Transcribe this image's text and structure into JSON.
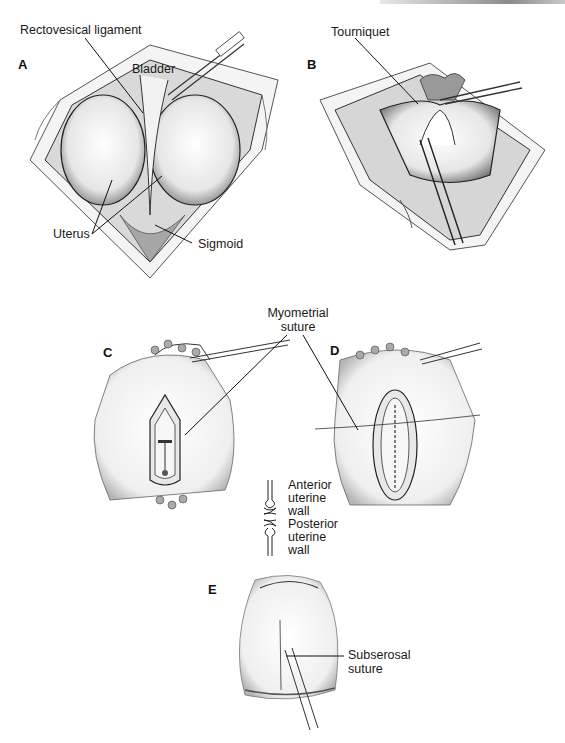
{
  "figure": {
    "panels": [
      {
        "id": "A",
        "letter": "A"
      },
      {
        "id": "B",
        "letter": "B"
      },
      {
        "id": "C",
        "letter": "C"
      },
      {
        "id": "D",
        "letter": "D"
      },
      {
        "id": "E",
        "letter": "E"
      }
    ],
    "labels": {
      "rectovesical_ligament": "Rectovesical ligament",
      "bladder": "Bladder",
      "uterus": "Uterus",
      "sigmoid": "Sigmoid",
      "tourniquet": "Tourniquet",
      "myometrial_suture_line1": "Myometrial",
      "myometrial_suture_line2": "suture",
      "anterior_line1": "Anterior",
      "anterior_line2": "uterine",
      "anterior_line3": "wall",
      "posterior_line1": "Posterior",
      "posterior_line2": "uterine",
      "posterior_line3": "wall",
      "subserosal_line1": "Subserosal",
      "subserosal_line2": "suture"
    }
  }
}
